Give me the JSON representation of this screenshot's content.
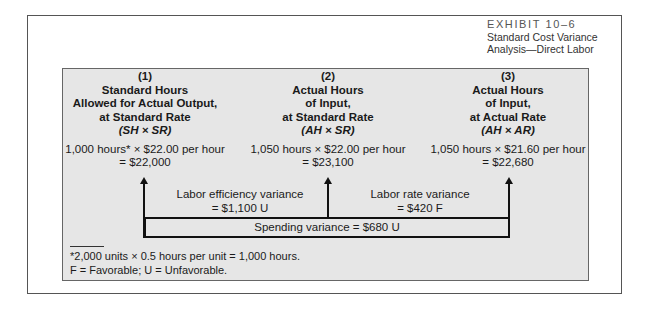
{
  "exhibit": {
    "number": "EXHIBIT 10–6",
    "title_line1": "Standard Cost Variance",
    "title_line2": "Analysis—Direct Labor"
  },
  "columns": [
    {
      "index": "(1)",
      "heading_lines": [
        "Standard Hours",
        "Allowed for Actual Output,",
        "at Standard Rate"
      ],
      "formula": "(SH × SR)",
      "calc_line1": "1,000 hours* × $22.00 per hour",
      "calc_line2": "= $22,000"
    },
    {
      "index": "(2)",
      "heading_lines": [
        "Actual Hours",
        "of Input,",
        "at Standard Rate"
      ],
      "formula": "(AH × SR)",
      "calc_line1": "1,050 hours × $22.00 per hour",
      "calc_line2": "= $23,100"
    },
    {
      "index": "(3)",
      "heading_lines": [
        "Actual Hours",
        "of Input,",
        "at Actual Rate"
      ],
      "formula": "(AH × AR)",
      "calc_line1": "1,050 hours × $21.60 per hour",
      "calc_line2": "= $22,680"
    }
  ],
  "variances": {
    "efficiency": {
      "label": "Labor efficiency variance",
      "value": "= $1,100 U"
    },
    "rate": {
      "label": "Labor rate variance",
      "value": "= $420 F"
    },
    "spending": {
      "label": "Spending variance = $680 U"
    }
  },
  "footnotes": {
    "line1": "*2,000 units × 0.5 hours per unit = 1,000 hours.",
    "line2": "F = Favorable; U = Unfavorable."
  },
  "colors": {
    "panel_bg": "#e6e6e6",
    "ink": "#111111",
    "frame": "#555555"
  }
}
